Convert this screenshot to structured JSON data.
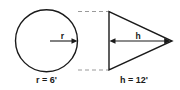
{
  "figure": {
    "background_color": "#ffffff",
    "line_color": "#1a1a1a",
    "dashed_connector_color": "#9a9a9a",
    "circle": {
      "name": "circle",
      "radius_arrow_label": "r",
      "caption": "r = 6'",
      "caption_variable": "r",
      "caption_value": "6",
      "caption_unit": "'"
    },
    "triangle": {
      "name": "triangle",
      "height_arrow_label": "h",
      "caption": "h = 12'",
      "caption_variable": "h",
      "caption_value": "12",
      "caption_unit": "'"
    },
    "connectors": {
      "top_dashed_label": "top-tangent-connector",
      "bottom_dashed_label": "bottom-tangent-connector"
    }
  }
}
